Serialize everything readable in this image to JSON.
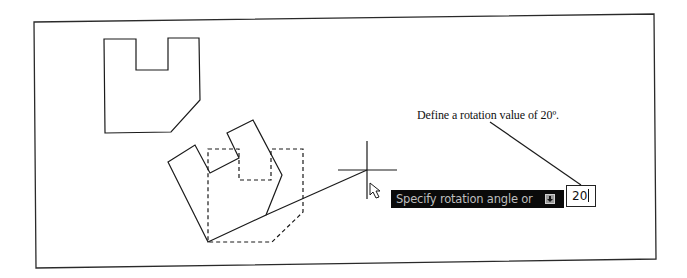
{
  "annotation": {
    "text": "Define a rotation value of 20º."
  },
  "dynamic_input": {
    "prompt": "Specify rotation angle or",
    "options_icon": "down-arrow-options-icon",
    "value": "20"
  },
  "colors": {
    "line": "#1a1a1a",
    "prompt_background": "#0a0a0a",
    "prompt_text": "#bdbdbd"
  },
  "drawing": {
    "frame": [
      [
        34,
        22
      ],
      [
        654,
        14
      ],
      [
        656,
        259
      ],
      [
        36,
        268
      ]
    ],
    "original_shape": [
      [
        104,
        39
      ],
      [
        136,
        39
      ],
      [
        136,
        70
      ],
      [
        168,
        70
      ],
      [
        168,
        38
      ],
      [
        199,
        38
      ],
      [
        200,
        100
      ],
      [
        171,
        132
      ],
      [
        105,
        133
      ]
    ],
    "rotated_preview_shape": [
      [
        168,
        162
      ],
      [
        195,
        145
      ],
      [
        210,
        173
      ],
      [
        239,
        158
      ],
      [
        227,
        133
      ],
      [
        253,
        120
      ],
      [
        282,
        175
      ],
      [
        266,
        215
      ],
      [
        208,
        242
      ]
    ],
    "dashed_base_shape": [
      [
        208,
        149
      ],
      [
        239,
        149
      ],
      [
        239,
        180
      ],
      [
        271,
        180
      ],
      [
        271,
        149
      ],
      [
        303,
        149
      ],
      [
        303,
        212
      ],
      [
        272,
        242
      ],
      [
        208,
        242
      ]
    ],
    "rubber_band_line": [
      [
        266,
        215
      ],
      [
        367,
        170
      ]
    ],
    "leader_line": [
      [
        490,
        122
      ],
      [
        581,
        185
      ]
    ],
    "crosshair_center": [
      367,
      170
    ]
  }
}
